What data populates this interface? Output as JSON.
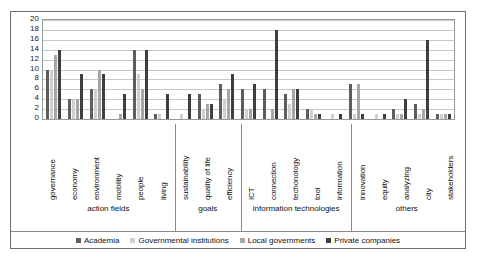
{
  "chart_data": {
    "type": "bar",
    "title": "",
    "xlabel": "",
    "ylabel": "",
    "ylim": [
      0,
      20
    ],
    "ytick_step": 2,
    "yticks": [
      20,
      18,
      16,
      14,
      12,
      10,
      8,
      6,
      4,
      2,
      0
    ],
    "grid": true,
    "legend_position": "bottom",
    "categories": [
      "governance",
      "economy",
      "environment",
      "mobility",
      "people",
      "living",
      "sustainability",
      "quality of life",
      "efficiency",
      "ICT",
      "connection",
      "techonology",
      "tool",
      "information",
      "innovation",
      "equity",
      "analyzing",
      "city",
      "stakeholders"
    ],
    "groups": [
      {
        "label": "action fields",
        "span": 6
      },
      {
        "label": "goals",
        "span": 3
      },
      {
        "label": "information technologies",
        "span": 5
      },
      {
        "label": "others",
        "span": 5
      }
    ],
    "series": [
      {
        "name": "Academia",
        "color": "#5d5d5d",
        "values": [
          10,
          4,
          6,
          0,
          14,
          1,
          0,
          5,
          7,
          6,
          6,
          5,
          2,
          0,
          7,
          0,
          2,
          3,
          1
        ]
      },
      {
        "name": "Governmental institutions",
        "color": "#cfcfcf",
        "values": [
          10,
          4,
          6,
          0,
          9,
          1,
          1,
          2,
          4,
          2,
          0,
          3,
          2,
          1,
          1,
          1,
          1,
          1,
          1
        ]
      },
      {
        "name": "Local governments",
        "color": "#a6a6a6",
        "values": [
          13,
          4,
          10,
          1,
          6,
          0,
          0,
          3,
          6,
          2,
          2,
          6,
          1,
          0,
          7,
          0,
          1,
          2,
          1
        ]
      },
      {
        "name": "Private companies",
        "color": "#3f3f3f",
        "values": [
          14,
          9,
          9,
          5,
          14,
          5,
          5,
          3,
          9,
          7,
          18,
          6,
          1,
          1,
          1,
          1,
          4,
          16,
          1
        ]
      }
    ]
  },
  "legend": {
    "items": [
      {
        "label": "Academia"
      },
      {
        "label": "Governmental institutions"
      },
      {
        "label": "Local governments"
      },
      {
        "label": "Private companies"
      }
    ]
  }
}
